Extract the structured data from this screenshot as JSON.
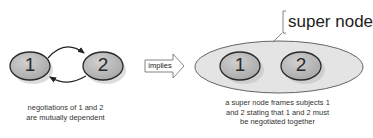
{
  "left_diagram": {
    "nodes": [
      {
        "id": "1",
        "label": "1"
      },
      {
        "id": "2",
        "label": "2"
      }
    ],
    "edges": [
      {
        "from": "1",
        "to": "2",
        "direction": "top"
      },
      {
        "from": "2",
        "to": "1",
        "direction": "bottom"
      }
    ],
    "caption_line1": "negotiations of 1 and 2",
    "caption_line2": "are mutually dependent"
  },
  "arrow": {
    "label": "implies"
  },
  "right_diagram": {
    "super_node_label": "super node",
    "nodes": [
      {
        "id": "1",
        "label": "1"
      },
      {
        "id": "2",
        "label": "2"
      }
    ],
    "caption_line1": "a super node frames subjects 1",
    "caption_line2": "and 2 stating that 1 and 2 must",
    "caption_line3": "be negotiated together"
  },
  "colors": {
    "node_fill": "#b8b8b8",
    "node_stroke": "#2a2a2a",
    "super_node_fill": "#e2e2e2",
    "super_node_stroke": "#555555",
    "shadow": "#d8d8d8"
  }
}
